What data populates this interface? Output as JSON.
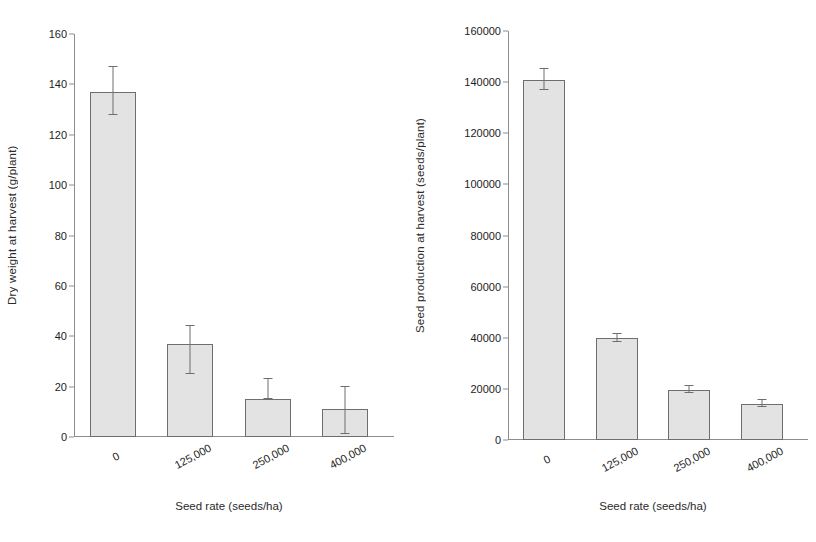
{
  "figure": {
    "panels": [
      "left",
      "right"
    ],
    "background": "#ffffff",
    "bar_fill": "#e3e3e3",
    "bar_border": "#6e6e6e",
    "axis_color": "#8d8d8d"
  },
  "chart_data": [
    {
      "type": "bar",
      "panel": "left",
      "title": "",
      "xlabel": "Seed rate (seeds/ha)",
      "ylabel": "Dry weight at harvest (g/plant)",
      "categories": [
        "0",
        "125,000",
        "250,000",
        "400,000"
      ],
      "values": [
        137,
        37,
        15,
        11
      ],
      "error_low": [
        128,
        25,
        15,
        1
      ],
      "error_high": [
        147,
        44,
        23,
        20
      ],
      "yticks": [
        0,
        20,
        40,
        60,
        80,
        100,
        120,
        140,
        160
      ],
      "ytick_labels": [
        "0",
        "20",
        "40",
        "60",
        "80",
        "100",
        "120",
        "140",
        "160"
      ],
      "ylim": [
        0,
        160
      ],
      "grid": false,
      "legend": "none"
    },
    {
      "type": "bar",
      "panel": "right",
      "title": "",
      "xlabel": "Seed rate (seeds/ha)",
      "ylabel": "Seed production at harvest (seeds/plant)",
      "categories": [
        "0",
        "125,000",
        "250,000",
        "400,000"
      ],
      "values": [
        141000,
        40000,
        19500,
        14000
      ],
      "error_low": [
        137000,
        38500,
        18500,
        13000
      ],
      "error_high": [
        145000,
        41500,
        21000,
        15500
      ],
      "yticks": [
        0,
        20000,
        40000,
        60000,
        80000,
        100000,
        120000,
        140000,
        160000
      ],
      "ytick_labels": [
        "0",
        "20000",
        "40000",
        "60000",
        "80000",
        "100000",
        "120000",
        "140000",
        "160000"
      ],
      "ylim": [
        0,
        160000
      ],
      "grid": false,
      "legend": "none"
    }
  ]
}
